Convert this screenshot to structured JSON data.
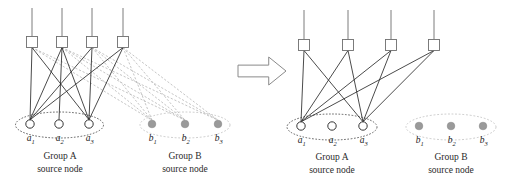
{
  "figure": {
    "type": "network-topology-diagram",
    "panels": [
      {
        "id": "before",
        "name": "left-panel",
        "groups": [
          {
            "id": "group-a",
            "caption_line1": "Group A",
            "caption_line2": "source node",
            "node_style": "hollow-circle",
            "ellipse_style": "dashed-dark",
            "nodes": [
              {
                "id": "a1",
                "label": "a",
                "sub": "1",
                "cx": 30,
                "cy": 124
              },
              {
                "id": "a2",
                "label": "a",
                "sub": "2",
                "cx": 59,
                "cy": 124
              },
              {
                "id": "a3",
                "label": "a",
                "sub": "3",
                "cx": 89,
                "cy": 124
              }
            ],
            "ellipse": {
              "cx": 59.5,
              "cy": 125,
              "rx": 44,
              "ry": 13
            },
            "caption_x": 60,
            "caption_y1": 159,
            "caption_y2": 172
          },
          {
            "id": "group-b",
            "caption_line1": "Group B",
            "caption_line2": "source node",
            "node_style": "filled-gray-circle",
            "ellipse_style": "dashed-gray",
            "nodes": [
              {
                "id": "b1",
                "label": "b",
                "sub": "1",
                "cx": 152,
                "cy": 124
              },
              {
                "id": "b2",
                "label": "b",
                "sub": "2",
                "cx": 185,
                "cy": 124
              },
              {
                "id": "b3",
                "label": "b",
                "sub": "3",
                "cx": 218,
                "cy": 124
              }
            ],
            "ellipse": {
              "cx": 185,
              "cy": 125,
              "rx": 45,
              "ry": 13
            },
            "caption_x": 185,
            "caption_y1": 159,
            "caption_y2": 172
          }
        ],
        "relays": [
          {
            "id": "r1",
            "cx": 32,
            "cy": 42,
            "antenna_top": 8
          },
          {
            "id": "r2",
            "cx": 62,
            "cy": 42,
            "antenna_top": 8
          },
          {
            "id": "r3",
            "cx": 92,
            "cy": 42,
            "antenna_top": 8
          },
          {
            "id": "r4",
            "cx": 123,
            "cy": 42,
            "antenna_top": 8
          }
        ],
        "links_solid": [
          [
            "r1",
            "a1"
          ],
          [
            "r1",
            "a3"
          ],
          [
            "r2",
            "a1"
          ],
          [
            "r2",
            "a2"
          ],
          [
            "r2",
            "a3"
          ],
          [
            "r3",
            "a1"
          ],
          [
            "r3",
            "a3"
          ],
          [
            "r4",
            "a1"
          ],
          [
            "r4",
            "a3"
          ]
        ],
        "links_dashed": [
          [
            "r1",
            "b1"
          ],
          [
            "r1",
            "b2"
          ],
          [
            "r2",
            "b1"
          ],
          [
            "r2",
            "b2"
          ],
          [
            "r2",
            "b3"
          ],
          [
            "r3",
            "b1"
          ],
          [
            "r3",
            "b2"
          ],
          [
            "r3",
            "b3"
          ],
          [
            "r4",
            "b1"
          ],
          [
            "r4",
            "b2"
          ],
          [
            "r4",
            "b3"
          ]
        ]
      },
      {
        "id": "after",
        "name": "right-panel",
        "groups": [
          {
            "id": "group-a",
            "caption_line1": "Group A",
            "caption_line2": "source node",
            "node_style": "hollow-circle",
            "ellipse_style": "dashed-dark",
            "nodes": [
              {
                "id": "a1",
                "label": "a",
                "sub": "1",
                "cx": 301,
                "cy": 126
              },
              {
                "id": "a2",
                "label": "a",
                "sub": "2",
                "cx": 332,
                "cy": 126
              },
              {
                "id": "a3",
                "label": "a",
                "sub": "3",
                "cx": 363,
                "cy": 126
              }
            ],
            "ellipse": {
              "cx": 332,
              "cy": 127,
              "rx": 45,
              "ry": 13
            },
            "caption_x": 332,
            "caption_y1": 160,
            "caption_y2": 173
          },
          {
            "id": "group-b",
            "caption_line1": "Group B",
            "caption_line2": "source node",
            "node_style": "filled-gray-circle",
            "ellipse_style": "dashed-gray",
            "nodes": [
              {
                "id": "b1",
                "label": "b",
                "sub": "1",
                "cx": 419,
                "cy": 126
              },
              {
                "id": "b2",
                "label": "b",
                "sub": "2",
                "cx": 451,
                "cy": 126
              },
              {
                "id": "b3",
                "label": "b",
                "sub": "3",
                "cx": 483,
                "cy": 126
              }
            ],
            "ellipse": {
              "cx": 451,
              "cy": 127,
              "rx": 45,
              "ry": 13
            },
            "caption_x": 451,
            "caption_y1": 160,
            "caption_y2": 173
          }
        ],
        "relays": [
          {
            "id": "r1",
            "cx": 304,
            "cy": 45,
            "antenna_top": 10
          },
          {
            "id": "r2",
            "cx": 348,
            "cy": 45,
            "antenna_top": 10
          },
          {
            "id": "r3",
            "cx": 391,
            "cy": 45,
            "antenna_top": 10
          },
          {
            "id": "r4",
            "cx": 434,
            "cy": 45,
            "antenna_top": 10
          }
        ],
        "links_solid": [
          [
            "r1",
            "a1"
          ],
          [
            "r1",
            "a3"
          ],
          [
            "r2",
            "a1"
          ],
          [
            "r2",
            "a3"
          ],
          [
            "r3",
            "a1"
          ],
          [
            "r3",
            "a3"
          ],
          [
            "r4",
            "a1"
          ],
          [
            "r4",
            "a3"
          ]
        ],
        "links_dashed": []
      }
    ],
    "arrow": {
      "name": "transition-arrow",
      "direction": "right",
      "x": 238,
      "y": 57,
      "width": 48,
      "height": 28
    },
    "geometry": {
      "relay_size": 11,
      "node_radius": 4.2,
      "gray_node_radius": 3.8
    },
    "colors": {
      "line_solid": "#2b2b2b",
      "line_dashed": "#b6b6b6",
      "relay_stroke": "#6e6e6e",
      "relay_fill": "#ffffff",
      "node_stroke": "#2b2b2b",
      "node_fill": "#ffffff",
      "gray_node_fill": "#9a9a9a",
      "gray_node_stroke": "#8a8a8a",
      "ellipse_dark": "#3a3a3a",
      "ellipse_gray": "#bdbdbd",
      "arrow_stroke": "#8a8a8a",
      "arrow_fill": "#ffffff",
      "text": "#1a1a1a",
      "background": "#ffffff"
    }
  }
}
